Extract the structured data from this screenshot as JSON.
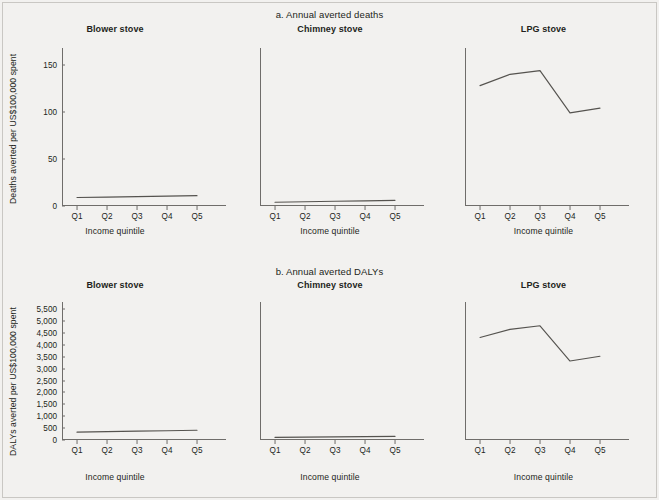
{
  "figure": {
    "background": "#f2f1ef",
    "line_color": "#55534f",
    "axis_color": "#6f6d6a"
  },
  "sections": [
    {
      "id": "a",
      "title": "a. Annual averted deaths",
      "ylabel": "Deaths averted per US$100,000 spent",
      "xlabel_blower": "Income quintile",
      "xlabel_chimney": "Income quintile",
      "xlabel_lpg": "Income quintile",
      "yticks": [
        "0",
        "50",
        "100",
        "150"
      ],
      "panels": [
        {
          "title": "Blower stove"
        },
        {
          "title": "Chimney stove"
        },
        {
          "title": "LPG stove"
        }
      ]
    },
    {
      "id": "b",
      "title": "b. Annual averted DALYs",
      "ylabel": "DALYs averted per US$100,000 spent",
      "xlabel_blower": "Income quintile",
      "xlabel_chimney": "Income quintile",
      "xlabel_lpg": "Income quintile",
      "yticks": [
        "0",
        "500",
        "1,000",
        "1,500",
        "2,000",
        "2,500",
        "3,000",
        "3,500",
        "4,000",
        "4,500",
        "5,000",
        "5,500"
      ],
      "panels": [
        {
          "title": "Blower stove"
        },
        {
          "title": "Chimney stove"
        },
        {
          "title": "LPG stove"
        }
      ]
    }
  ],
  "xticks": [
    "Q1",
    "Q2",
    "Q3",
    "Q4",
    "Q5"
  ],
  "chart_data": [
    {
      "type": "line",
      "title": "a. Annual averted deaths",
      "panel": "Blower stove",
      "xlabel": "Income quintile",
      "ylabel": "Deaths averted per US$100,000 spent",
      "categories": [
        "Q1",
        "Q2",
        "Q3",
        "Q4",
        "Q5"
      ],
      "values": [
        9,
        9.5,
        10,
        10.5,
        11
      ],
      "ylim": [
        0,
        168
      ],
      "yticks": [
        0,
        50,
        100,
        150
      ],
      "grid": false,
      "legend": "none"
    },
    {
      "type": "line",
      "title": "a. Annual averted deaths",
      "panel": "Chimney stove",
      "xlabel": "Income quintile",
      "ylabel": "Deaths averted per US$100,000 spent",
      "categories": [
        "Q1",
        "Q2",
        "Q3",
        "Q4",
        "Q5"
      ],
      "values": [
        4,
        4.5,
        5,
        5.5,
        6
      ],
      "ylim": [
        0,
        168
      ],
      "yticks": [
        0,
        50,
        100,
        150
      ],
      "grid": false,
      "legend": "none"
    },
    {
      "type": "line",
      "title": "a. Annual averted deaths",
      "panel": "LPG stove",
      "xlabel": "Income quintile",
      "ylabel": "Deaths averted per US$100,000 spent",
      "categories": [
        "Q1",
        "Q2",
        "Q3",
        "Q4",
        "Q5"
      ],
      "values": [
        128,
        140,
        144,
        99,
        104
      ],
      "ylim": [
        0,
        168
      ],
      "yticks": [
        0,
        50,
        100,
        150
      ],
      "grid": false,
      "legend": "none"
    },
    {
      "type": "line",
      "title": "b. Annual averted DALYs",
      "panel": "Blower stove",
      "xlabel": "Income quintile",
      "ylabel": "DALYs averted per US$100,000 spent",
      "categories": [
        "Q1",
        "Q2",
        "Q3",
        "Q4",
        "Q5"
      ],
      "values": [
        330,
        350,
        370,
        390,
        410
      ],
      "ylim": [
        0,
        5800
      ],
      "yticks": [
        0,
        500,
        1000,
        1500,
        2000,
        2500,
        3000,
        3500,
        4000,
        4500,
        5000,
        5500
      ],
      "grid": false,
      "legend": "none"
    },
    {
      "type": "line",
      "title": "b. Annual averted DALYs",
      "panel": "Chimney stove",
      "xlabel": "Income quintile",
      "ylabel": "DALYs averted per US$100,000 spent",
      "categories": [
        "Q1",
        "Q2",
        "Q3",
        "Q4",
        "Q5"
      ],
      "values": [
        110,
        120,
        130,
        140,
        150
      ],
      "ylim": [
        0,
        5800
      ],
      "yticks": [
        0,
        500,
        1000,
        1500,
        2000,
        2500,
        3000,
        3500,
        4000,
        4500,
        5000,
        5500
      ],
      "grid": false,
      "legend": "none"
    },
    {
      "type": "line",
      "title": "b. Annual averted DALYs",
      "panel": "LPG stove",
      "xlabel": "Income quintile",
      "ylabel": "DALYs averted per US$100,000 spent",
      "categories": [
        "Q1",
        "Q2",
        "Q3",
        "Q4",
        "Q5"
      ],
      "values": [
        4310,
        4650,
        4800,
        3320,
        3520
      ],
      "ylim": [
        0,
        5800
      ],
      "yticks": [
        0,
        500,
        1000,
        1500,
        2000,
        2500,
        3000,
        3500,
        4000,
        4500,
        5000,
        5500
      ],
      "grid": false,
      "legend": "none"
    }
  ]
}
